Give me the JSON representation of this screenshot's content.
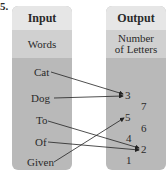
{
  "problem_number": "5.",
  "input": {
    "header": "Input",
    "subheader": "Words",
    "items": [
      "Cat",
      "Dog",
      "To",
      "Of",
      "Given"
    ]
  },
  "output": {
    "header": "Output",
    "subheader_line1": "Number",
    "subheader_line2": "of Letters",
    "items": [
      "3",
      "7",
      "5",
      "6",
      "4",
      "2",
      "1"
    ]
  },
  "mappings": [
    {
      "from": "Cat",
      "to": "3"
    },
    {
      "from": "Dog",
      "to": "3"
    },
    {
      "from": "To",
      "to": "2"
    },
    {
      "from": "Of",
      "to": "2"
    },
    {
      "from": "Given",
      "to": "5"
    }
  ],
  "colors": {
    "header_bg": "#e6e6e6",
    "subheader_bg": "#d0d0d0",
    "body_bg": "#b9b9b9",
    "arrow": "#222222"
  }
}
